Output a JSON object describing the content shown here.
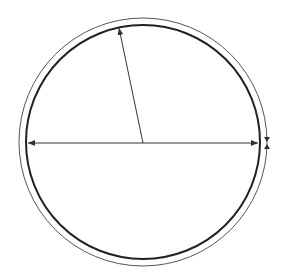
{
  "diagram": {
    "type": "concentric-circles-dimension",
    "center": [
      143,
      142
    ],
    "outer_circle": {
      "radius": 124,
      "stroke": "#555555",
      "width": 1
    },
    "inner_circle": {
      "radius": 117,
      "stroke": "#222222",
      "width": 2
    },
    "diameter_arrow": {
      "from": [
        27,
        143
      ],
      "to": [
        259,
        143
      ],
      "double_headed": true
    },
    "radius_arrow": {
      "from": [
        143,
        143
      ],
      "to": [
        119,
        27
      ]
    },
    "thickness_markers": {
      "x": 267,
      "top_y": 135,
      "bottom_y": 150
    },
    "colors": {
      "background": "#ffffff",
      "line": "#333333"
    }
  }
}
